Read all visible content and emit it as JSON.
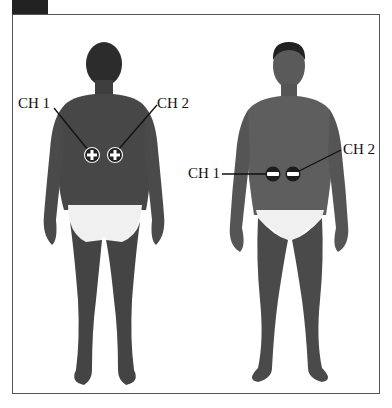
{
  "figure": {
    "views": [
      {
        "name": "back-view",
        "electrode_symbol": "plus",
        "labels": {
          "ch1": "CH 1",
          "ch2": "CH 2"
        }
      },
      {
        "name": "front-view",
        "electrode_symbol": "minus",
        "labels": {
          "ch1": "CH 1",
          "ch2": "CH 2"
        }
      }
    ]
  },
  "colors": {
    "skin_back": "#4a4a4a",
    "skin_front": "#5a5a5a",
    "hair": "#2a2a2a",
    "underwear": "#f2f2f2",
    "electrode": "#222222",
    "frame": "#555555",
    "tab": "#222222"
  }
}
